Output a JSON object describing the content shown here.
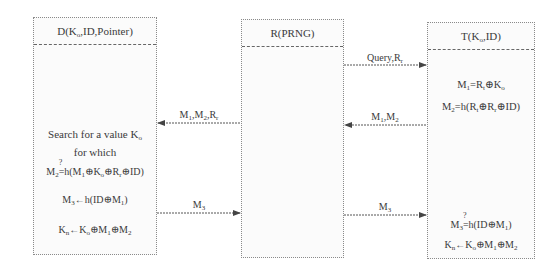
{
  "entities": {
    "d": {
      "title": "D(K",
      "title_sub": "o",
      "title_rest": ",ID,Pointer)"
    },
    "r": {
      "title": "R(PRNG)"
    },
    "t": {
      "title": "T(K",
      "title_sub": "o",
      "title_rest": ",ID)"
    }
  },
  "t_ops": {
    "line1": {
      "a": "M",
      "a_sub": "1",
      "b": "=R",
      "b_sub": "t",
      "c": "⊕K",
      "c_sub": "o"
    },
    "line2": {
      "a": "M",
      "a_sub": "2",
      "b": "=h(R",
      "b_sub": "t",
      "c": "⊕R",
      "c_sub": "r",
      "d": "⊕ID)"
    },
    "line3": {
      "a": "M",
      "a_sub": "3",
      "q": "?",
      "b": "=h(ID⊕M",
      "b_sub": "1",
      "c": ")"
    },
    "line4": {
      "a": "K",
      "a_sub": "n",
      "b": "←K",
      "b_sub": "o",
      "c": "⊕M",
      "c_sub": "1",
      "d": "⊕M",
      "d_sub": "2"
    }
  },
  "d_ops": {
    "search1": "Search for a value K",
    "search1_sub": "o",
    "search2": "for which",
    "check": {
      "a": "M",
      "a_sub": "2",
      "q": "?",
      "b": "=h(M",
      "b_sub": "1",
      "c": "⊕K",
      "c_sub": "o",
      "d": "⊕R",
      "d_sub": "r",
      "e": "⊕ID)"
    },
    "m3": {
      "a": "M",
      "a_sub": "3",
      "b": "←h(ID⊕M",
      "b_sub": "1",
      "c": ")"
    },
    "kn": {
      "a": "K",
      "a_sub": "n",
      "b": "←K",
      "b_sub": "o",
      "c": "⊕M",
      "c_sub": "1",
      "d": "⊕M",
      "d_sub": "2"
    }
  },
  "messages": [
    {
      "from": "R",
      "to": "T",
      "label": "Query,R",
      "label_sub": "r"
    },
    {
      "from": "T",
      "to": "R",
      "label": "M",
      "label_sub": "1",
      "label_rest": ",M",
      "label_sub2": "2"
    },
    {
      "from": "R",
      "to": "D",
      "label": "M",
      "label_sub": "1",
      "label_rest": ",M",
      "label_sub2": "2",
      "label_rest2": ",R",
      "label_sub3": "r"
    },
    {
      "from": "D",
      "to": "R",
      "label": "M",
      "label_sub": "3"
    },
    {
      "from": "R",
      "to": "T",
      "label": "M",
      "label_sub": "3"
    }
  ]
}
